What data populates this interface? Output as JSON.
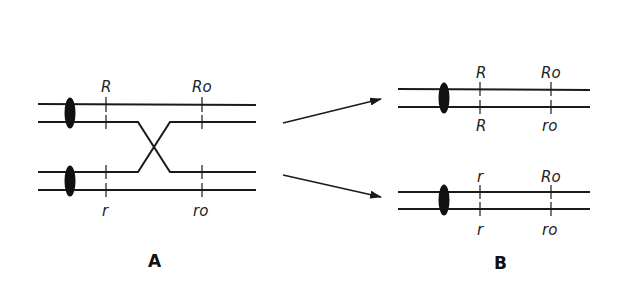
{
  "figure": {
    "panels": [
      {
        "id": "A",
        "label": "A",
        "loci_top": [
          "R",
          "Ro"
        ],
        "loci_bottom": [
          "r",
          "ro"
        ],
        "event": "crossover between chromatids 2 and 3"
      },
      {
        "id": "B",
        "label": "B",
        "chromosomes": [
          {
            "top_labels": [
              "R",
              "Ro"
            ],
            "bottom_labels": [
              "R",
              "ro"
            ]
          },
          {
            "top_labels": [
              "r",
              "Ro"
            ],
            "bottom_labels": [
              "r",
              "ro"
            ]
          }
        ]
      }
    ],
    "colors": {
      "line": "#1a1a1a",
      "background": "#ffffff"
    }
  }
}
